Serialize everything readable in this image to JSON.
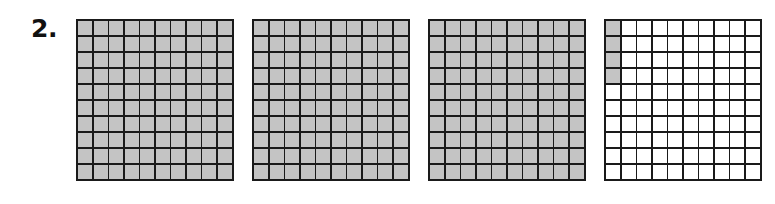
{
  "problem": {
    "number_label": "2."
  },
  "colors": {
    "shaded": "#c4c4c4",
    "unshaded": "#ffffff",
    "grid_line": "#1a1a1a"
  },
  "grids": [
    {
      "rows": 10,
      "cols": 10,
      "shaded_count": 100,
      "shaded_cells": "all"
    },
    {
      "rows": 10,
      "cols": 10,
      "shaded_count": 100,
      "shaded_cells": "all"
    },
    {
      "rows": 10,
      "cols": 10,
      "shaded_count": 100,
      "shaded_cells": "all"
    },
    {
      "rows": 10,
      "cols": 10,
      "shaded_count": 4,
      "shaded_cells": [
        [
          0,
          0
        ],
        [
          1,
          0
        ],
        [
          2,
          0
        ],
        [
          3,
          0
        ]
      ]
    }
  ]
}
